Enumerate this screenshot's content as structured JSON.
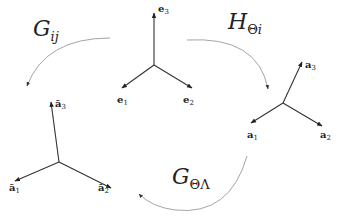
{
  "frames": {
    "center": {
      "name": "e",
      "vectors": [
        {
          "base": "e",
          "sub": "1"
        },
        {
          "base": "e",
          "sub": "2"
        },
        {
          "base": "e",
          "sub": "3"
        }
      ]
    },
    "right": {
      "name": "a",
      "vectors": [
        {
          "base": "a",
          "sub": "1"
        },
        {
          "base": "a",
          "sub": "2"
        },
        {
          "base": "a",
          "sub": "3"
        }
      ]
    },
    "left": {
      "name": "a-bar",
      "vectors": [
        {
          "base": "ā",
          "sub": "1"
        },
        {
          "base": "ā",
          "sub": "2"
        },
        {
          "base": "ā",
          "sub": "3"
        }
      ]
    }
  },
  "transforms": {
    "g_ij": {
      "base": "G",
      "sub": "ij"
    },
    "h_theta_i": {
      "base": "H",
      "sub_upright": "Θ",
      "sub_italic": "i"
    },
    "g_theta_lambda": {
      "base": "G",
      "sub_upright": "ΘΛ"
    }
  },
  "colors": {
    "axis": "#333333",
    "arc": "#9a9a9a",
    "text": "#222222",
    "background": "#ffffff"
  }
}
